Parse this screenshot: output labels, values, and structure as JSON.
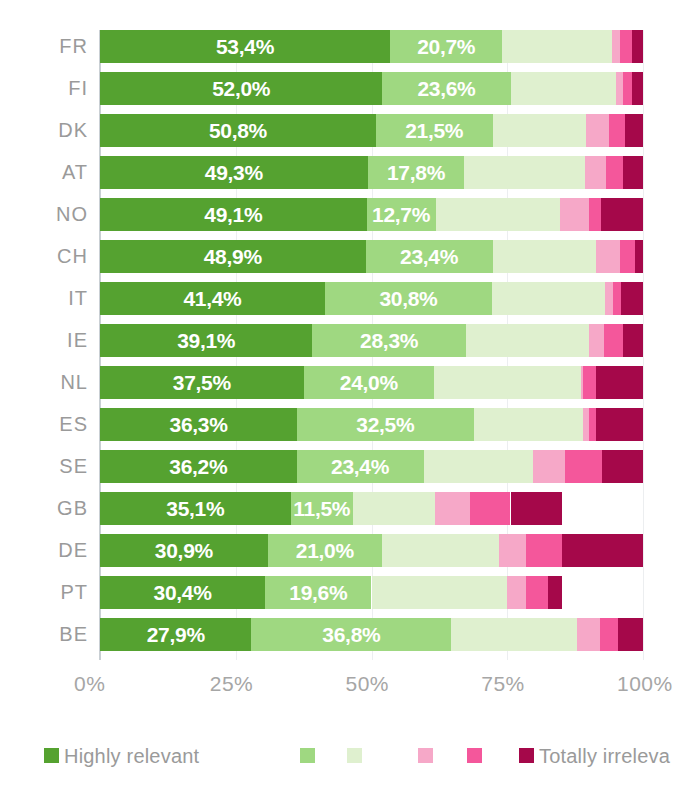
{
  "chart_data": {
    "type": "bar",
    "orientation": "horizontal",
    "stacked": true,
    "title": "",
    "xlabel": "",
    "ylabel": "",
    "xlim": [
      0,
      100
    ],
    "xticks": [
      "0%",
      "25%",
      "50%",
      "75%",
      "100%"
    ],
    "xtick_values": [
      0,
      25,
      50,
      75,
      100
    ],
    "grid": true,
    "legend_position": "bottom",
    "categories": [
      "FR",
      "FI",
      "DK",
      "AT",
      "NO",
      "CH",
      "IT",
      "IE",
      "NL",
      "ES",
      "SE",
      "GB",
      "DE",
      "PT",
      "BE"
    ],
    "series": [
      {
        "name": "Highly relevant",
        "color": "#55a230",
        "values": [
          53.4,
          52.0,
          50.8,
          49.3,
          49.1,
          48.9,
          41.4,
          39.1,
          37.5,
          36.3,
          36.2,
          35.1,
          30.9,
          30.4,
          27.9
        ]
      },
      {
        "name": "",
        "color": "#9fd881",
        "values": [
          20.7,
          23.6,
          21.5,
          17.8,
          12.7,
          23.4,
          30.8,
          28.3,
          24.0,
          32.5,
          23.4,
          11.5,
          21.0,
          19.6,
          36.8
        ]
      },
      {
        "name": "",
        "color": "#dff0cf",
        "values": [
          20.2,
          19.4,
          17.2,
          22.3,
          23.0,
          19.1,
          20.8,
          22.6,
          27.0,
          20.2,
          20.1,
          15.1,
          21.6,
          25.0,
          23.2
        ]
      },
      {
        "name": "",
        "color": "#f6a8c8",
        "values": [
          1.5,
          1.3,
          4.2,
          3.7,
          5.3,
          4.4,
          1.5,
          2.9,
          0.4,
          1.0,
          6.0,
          6.5,
          5.0,
          3.4,
          4.2
        ]
      },
      {
        "name": "",
        "color": "#f4579b",
        "values": [
          2.2,
          1.6,
          3.0,
          3.2,
          2.2,
          2.8,
          1.5,
          3.5,
          2.4,
          1.4,
          6.8,
          7.4,
          6.5,
          4.1,
          3.3
        ]
      },
      {
        "name": "Totally irreleva",
        "color": "#a5084a",
        "values": [
          2.0,
          2.1,
          3.3,
          3.7,
          7.7,
          1.4,
          4.0,
          3.6,
          8.7,
          8.6,
          7.5,
          9.4,
          15.0,
          2.5,
          4.6
        ]
      }
    ],
    "bar_labels": {
      "series0": [
        "53,4%",
        "52,0%",
        "50,8%",
        "49,3%",
        "49,1%",
        "48,9%",
        "41,4%",
        "39,1%",
        "37,5%",
        "36,3%",
        "36,2%",
        "35,1%",
        "30,9%",
        "30,4%",
        "27,9%"
      ],
      "series1": [
        "20,7%",
        "23,6%",
        "21,5%",
        "17,8%",
        "12,7%",
        "23,4%",
        "30,8%",
        "28,3%",
        "24,0%",
        "32,5%",
        "23,4%",
        "11,5%",
        "21,0%",
        "19,6%",
        "36,8%"
      ]
    }
  },
  "legend": {
    "items": [
      {
        "color": "#55a230",
        "label": "Highly relevant"
      },
      {
        "color": "#9fd881",
        "label": ""
      },
      {
        "color": "#dff0cf",
        "label": ""
      },
      {
        "color": "#f6a8c8",
        "label": ""
      },
      {
        "color": "#f4579b",
        "label": ""
      },
      {
        "color": "#a5084a",
        "label": "Totally irreleva"
      }
    ]
  },
  "colors": {
    "highly_relevant": "#55a230",
    "green_mid": "#9fd881",
    "green_light": "#dff0cf",
    "pink_light": "#f6a8c8",
    "pink": "#f4579b",
    "totally_irrelevant": "#a5084a",
    "axis": "#c9cfd4",
    "grid": "#eceef0",
    "text": "#9a9a9a"
  }
}
